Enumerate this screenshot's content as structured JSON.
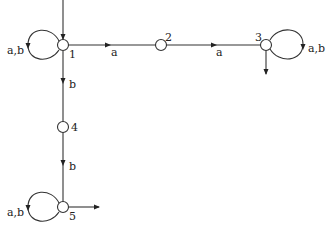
{
  "diagram": {
    "type": "finite-automaton",
    "states": [
      {
        "id": "1",
        "label": "1",
        "initial": true,
        "final": false,
        "self_loop": "a,b"
      },
      {
        "id": "2",
        "label": "2",
        "initial": false,
        "final": false
      },
      {
        "id": "3",
        "label": "3",
        "initial": false,
        "final": true,
        "self_loop": "a,b"
      },
      {
        "id": "4",
        "label": "4",
        "initial": false,
        "final": false
      },
      {
        "id": "5",
        "label": "5",
        "initial": false,
        "final": true,
        "self_loop": "a,b"
      }
    ],
    "transitions": [
      {
        "from": "1",
        "to": "2",
        "label": "a"
      },
      {
        "from": "2",
        "to": "3",
        "label": "a"
      },
      {
        "from": "1",
        "to": "4",
        "label": "b"
      },
      {
        "from": "4",
        "to": "5",
        "label": "b"
      }
    ],
    "labels": {
      "s1": "1",
      "s2": "2",
      "s3": "3",
      "s4": "4",
      "s5": "5",
      "loop1": "a,b",
      "loop3": "a,b",
      "loop5": "a,b",
      "e12": "a",
      "e23": "a",
      "e14": "b",
      "e45": "b"
    },
    "colors": {
      "stroke": "#333333",
      "background": "#ffffff"
    }
  }
}
